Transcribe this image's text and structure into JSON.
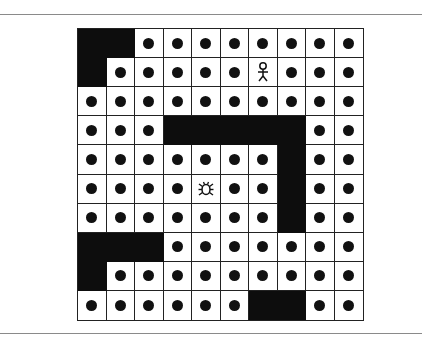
{
  "game": {
    "type": "maze-grid",
    "rows": 10,
    "cols": 10,
    "legend": {
      "W": "wall",
      "D": "pellet",
      "P": "player",
      "B": "bug-enemy"
    },
    "grid": [
      [
        "W",
        "W",
        "D",
        "D",
        "D",
        "D",
        "D",
        "D",
        "D",
        "D"
      ],
      [
        "W",
        "D",
        "D",
        "D",
        "D",
        "D",
        "P",
        "D",
        "D",
        "D"
      ],
      [
        "D",
        "D",
        "D",
        "D",
        "D",
        "D",
        "D",
        "D",
        "D",
        "D"
      ],
      [
        "D",
        "D",
        "D",
        "W",
        "W",
        "W",
        "W",
        "W",
        "D",
        "D"
      ],
      [
        "D",
        "D",
        "D",
        "D",
        "D",
        "D",
        "D",
        "W",
        "D",
        "D"
      ],
      [
        "D",
        "D",
        "D",
        "D",
        "B",
        "D",
        "D",
        "W",
        "D",
        "D"
      ],
      [
        "D",
        "D",
        "D",
        "D",
        "D",
        "D",
        "D",
        "W",
        "D",
        "D"
      ],
      [
        "W",
        "W",
        "W",
        "D",
        "D",
        "D",
        "D",
        "D",
        "D",
        "D"
      ],
      [
        "W",
        "D",
        "D",
        "D",
        "D",
        "D",
        "D",
        "D",
        "D",
        "D"
      ],
      [
        "D",
        "D",
        "D",
        "D",
        "D",
        "D",
        "W",
        "W",
        "D",
        "D"
      ]
    ],
    "player": {
      "row": 1,
      "col": 6,
      "icon": "stick-figure-icon"
    },
    "enemy": {
      "row": 5,
      "col": 4,
      "icon": "bug-icon"
    },
    "colors": {
      "wall": "#0d0d0d",
      "pellet": "#111111",
      "floor": "#ffffff",
      "grid_line": "#222222"
    }
  }
}
